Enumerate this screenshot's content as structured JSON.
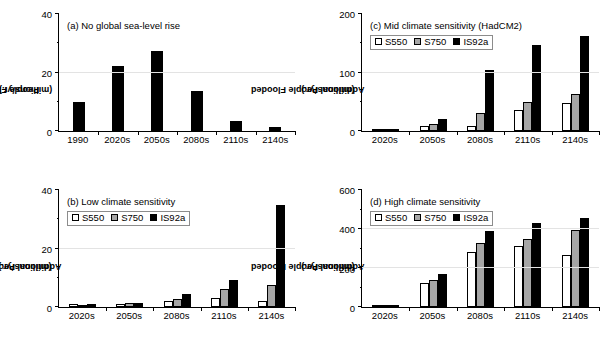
{
  "figure": {
    "series_names": [
      "S550",
      "S750",
      "IS92a"
    ],
    "colors": {
      "s550": "#ffffff",
      "s750": "#a6a6a6",
      "is92a": "#000000",
      "grid": "#e3e3e3",
      "axis": "#000000"
    }
  },
  "chart_data": [
    {
      "id": "a",
      "type": "bar",
      "title": "(a) No global sea-level rise",
      "ylabel": "People Flooded\n(millions/yr.)",
      "ylabel_line1": "People Flooded",
      "ylabel_line2": "(millions/yr.)",
      "xlabel": "",
      "categories": [
        "1990",
        "2020s",
        "2050s",
        "2080s",
        "2110s",
        "2140s"
      ],
      "values": [
        10.0,
        22.0,
        27.0,
        13.5,
        3.5,
        1.5
      ],
      "ylim": [
        0,
        40
      ],
      "yticks": [
        0,
        20,
        40
      ],
      "yticklabels": [
        "0",
        "20",
        "40"
      ],
      "yminorticks": [
        10,
        30
      ],
      "gridlines": [
        20
      ],
      "grid": true,
      "legend": null,
      "single_series": true
    },
    {
      "id": "b",
      "type": "bar",
      "title": "(b) Low climate sensitivity",
      "ylabel_line1": "Additional People Flooded",
      "ylabel_line2": "(millions/yr.)",
      "xlabel": "",
      "categories": [
        "2020s",
        "2050s",
        "2080s",
        "2110s",
        "2140s"
      ],
      "series": [
        {
          "name": "S550",
          "values": [
            0.9,
            1.1,
            1.9,
            3.1,
            2.2
          ]
        },
        {
          "name": "S750",
          "values": [
            0.8,
            1.2,
            2.8,
            6.0,
            7.5
          ]
        },
        {
          "name": "IS92a",
          "values": [
            1.0,
            1.4,
            4.4,
            9.3,
            34.5
          ]
        }
      ],
      "ylim": [
        0,
        40
      ],
      "yticks": [
        0,
        20,
        40
      ],
      "yticklabels": [
        "0",
        "20",
        "40"
      ],
      "yminorticks": [
        10,
        30
      ],
      "gridlines": [
        20
      ],
      "grid": true,
      "legend": {
        "position": "top-left",
        "entries": [
          "S550",
          "S750",
          "IS92a"
        ]
      },
      "single_series": false
    },
    {
      "id": "c",
      "type": "bar",
      "title": "(c) Mid climate sensitivity (HadCM2)",
      "ylabel_line1": "Additional People Flooded",
      "ylabel_line2": "(millions/yr.)",
      "xlabel": "",
      "categories": [
        "2020s",
        "2050s",
        "2080s",
        "2110s",
        "2140s"
      ],
      "series": [
        {
          "name": "S550",
          "values": [
            0.8,
            8.5,
            8.0,
            36.0,
            47.0
          ]
        },
        {
          "name": "S750",
          "values": [
            0.8,
            11.5,
            30.0,
            49.0,
            63.0
          ]
        },
        {
          "name": "IS92a",
          "values": [
            1.0,
            20.5,
            103.0,
            146.0,
            161.0
          ]
        }
      ],
      "ylim": [
        0,
        200
      ],
      "yticks": [
        0,
        100,
        200
      ],
      "yticklabels": [
        "0",
        "100",
        "200"
      ],
      "yminorticks": [
        50,
        150
      ],
      "gridlines": [
        100
      ],
      "grid": true,
      "legend": {
        "position": "top-left",
        "entries": [
          "S550",
          "S750",
          "IS92a"
        ]
      },
      "single_series": false
    },
    {
      "id": "d",
      "type": "bar",
      "title": "(d) High climate sensitivity",
      "ylabel_line1": "Additional People Flooded",
      "ylabel_line2": "(millions/yr.)",
      "xlabel": "",
      "categories": [
        "2020s",
        "2050s",
        "2080s",
        "2110s",
        "2140s"
      ],
      "series": [
        {
          "name": "S550",
          "values": [
            5.0,
            121.0,
            280.0,
            310.0,
            263.0
          ]
        },
        {
          "name": "S750",
          "values": [
            5.0,
            136.0,
            326.0,
            345.0,
            392.0
          ]
        },
        {
          "name": "IS92a",
          "values": [
            8.0,
            166.0,
            389.0,
            429.0,
            455.0
          ]
        }
      ],
      "ylim": [
        0,
        600
      ],
      "yticks": [
        0,
        200,
        400,
        600
      ],
      "yticklabels": [
        "0",
        "200",
        "400",
        "600"
      ],
      "yminorticks": [
        100,
        300,
        500
      ],
      "gridlines": [
        200,
        400
      ],
      "grid": true,
      "legend": {
        "position": "top-left",
        "entries": [
          "S550",
          "S750",
          "IS92a"
        ]
      },
      "single_series": false
    }
  ]
}
